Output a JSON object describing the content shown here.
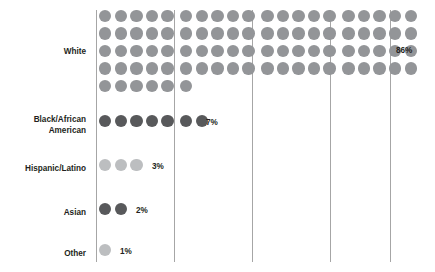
{
  "chart_data": {
    "type": "bar",
    "chart_style": "waffle-dot-pictogram",
    "title": "",
    "subtitle": "",
    "xlabel": "",
    "ylabel": "",
    "categories": [
      "White",
      "Black/African American",
      "Hispanic/Latino",
      "Asian",
      "Other"
    ],
    "values": [
      86,
      7,
      3,
      2,
      1
    ],
    "value_labels": [
      "86%",
      "7%",
      "3%",
      "2%",
      "1%"
    ],
    "unit": "percent",
    "dot_unit_value": 1,
    "dots_per_row": 20,
    "dots_per_section": 5,
    "sections": 4,
    "grid": true,
    "gridline_count": 5,
    "legend": "none",
    "xlim": [
      0,
      100
    ],
    "annotations": []
  },
  "chart": {
    "rows": [
      {
        "label": "White",
        "label_lines": "White",
        "value": 86,
        "value_label": "86%",
        "dot_color": "#939598",
        "row_top": 10,
        "label_top": 47,
        "dot_rows": [
          20,
          20,
          20,
          20,
          6
        ],
        "pct_left": 396,
        "pct_top": 46
      },
      {
        "label": "Black/African American",
        "label_lines": "Black/African\nAmerican",
        "value": 7,
        "value_label": "7%",
        "dot_color": "#58595b",
        "row_top": 115,
        "label_top": 115,
        "dot_rows": [
          7
        ],
        "pct_left": 206,
        "pct_top": 118
      },
      {
        "label": "Hispanic/Latino",
        "label_lines": "Hispanic/Latino",
        "value": 3,
        "value_label": "3%",
        "dot_color": "#bcbec0",
        "row_top": 159,
        "label_top": 164,
        "dot_rows": [
          3
        ],
        "pct_left": 152,
        "pct_top": 162
      },
      {
        "label": "Asian",
        "label_lines": "Asian",
        "value": 2,
        "value_label": "2%",
        "dot_color": "#58595b",
        "row_top": 203,
        "label_top": 208,
        "dot_rows": [
          2
        ],
        "pct_left": 136,
        "pct_top": 206
      },
      {
        "label": "Other",
        "label_lines": "Other",
        "value": 1,
        "value_label": "1%",
        "dot_color": "#bcbec0",
        "row_top": 244,
        "label_top": 249,
        "dot_rows": [
          1
        ],
        "pct_left": 120,
        "pct_top": 247
      }
    ],
    "gridlines": [
      {
        "name": "gridline-axis-left",
        "x": 96
      },
      {
        "name": "gridline-divider-1",
        "x": 174
      },
      {
        "name": "gridline-divider-2",
        "x": 252
      },
      {
        "name": "gridline-divider-3",
        "x": 330
      },
      {
        "name": "gridline-axis-right",
        "x": 390
      }
    ],
    "colors": {
      "dot_medium": "#939598",
      "dot_dark": "#58595b",
      "dot_light": "#bcbec0",
      "gridline": "#a6a6a6",
      "text": "#231f20",
      "background": "#ffffff"
    }
  }
}
